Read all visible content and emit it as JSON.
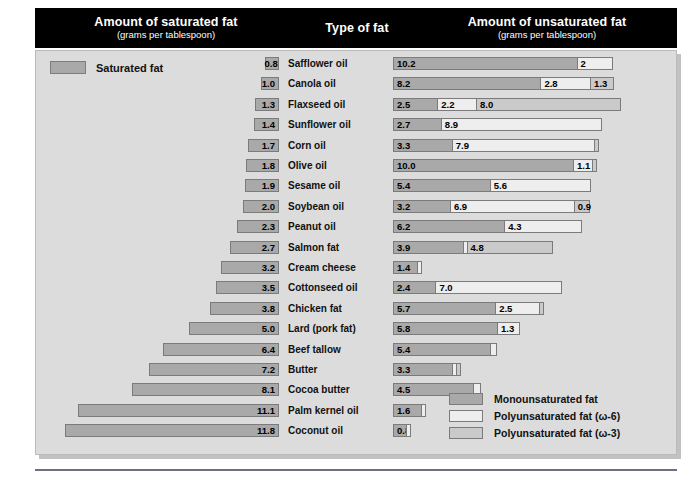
{
  "header": {
    "saturated_title": "Amount of saturated fat",
    "saturated_sub": "(grams per tablespoon)",
    "type_title": "Type of fat",
    "unsaturated_title": "Amount of unsaturated fat",
    "unsaturated_sub": "(grams per tablespoon)"
  },
  "key": {
    "saturated_label": "Saturated fat"
  },
  "legend": {
    "mono": "Monounsaturated fat",
    "omega6": "Polyunsaturated fat (ω-6)",
    "omega3": "Polyunsaturated fat (ω-3)"
  },
  "colors": {
    "monounsaturated": "#a9a9a9",
    "omega6": "#eeeeee",
    "omega3": "#cacaca",
    "panel": "#dcdcdc",
    "header_band": "#000000",
    "rule": "#6f6f84"
  },
  "chart_data": {
    "type": "bar",
    "subtitle": "grams per tablespoon",
    "orientation": "horizontal-diverging",
    "xlabel": "grams per tablespoon",
    "ylabel": "Type of fat",
    "grid": false,
    "legend_position": "bottom-right",
    "left_axis": {
      "label": "Amount of saturated fat",
      "units": "grams per tablespoon",
      "direction": "right-to-left",
      "max": 11.8
    },
    "right_axis": {
      "label": "Amount of unsaturated fat",
      "units": "grams per tablespoon",
      "direction": "left-to-right",
      "max": 12.7
    },
    "series": [
      {
        "name": "Saturated fat",
        "key": "saturated",
        "color": "#a9a9a9"
      },
      {
        "name": "Monounsaturated fat",
        "key": "monounsaturated",
        "color": "#a9a9a9"
      },
      {
        "name": "Polyunsaturated fat (ω-6)",
        "key": "omega6",
        "color": "#eeeeee"
      },
      {
        "name": "Polyunsaturated fat (ω-3)",
        "key": "omega3",
        "color": "#cacaca"
      }
    ],
    "categories": [
      "Safflower oil",
      "Canola oil",
      "Flaxseed oil",
      "Sunflower oil",
      "Corn oil",
      "Olive oil",
      "Sesame oil",
      "Soybean oil",
      "Peanut oil",
      "Salmon fat",
      "Cream cheese",
      "Cottonseed oil",
      "Chicken fat",
      "Lard (pork fat)",
      "Beef tallow",
      "Butter",
      "Cocoa butter",
      "Palm kernel oil",
      "Coconut oil"
    ],
    "rows": [
      {
        "name": "Safflower oil",
        "saturated": 0.8,
        "saturated_label": "0.8",
        "monounsaturated": 10.2,
        "mono_label": "10.2",
        "omega6": 2.0,
        "omega6_label": "2",
        "omega3": 0.0,
        "omega3_label": ""
      },
      {
        "name": "Canola oil",
        "saturated": 1.0,
        "saturated_label": "1.0",
        "monounsaturated": 8.2,
        "mono_label": "8.2",
        "omega6": 2.8,
        "omega6_label": "2.8",
        "omega3": 1.3,
        "omega3_label": "1.3"
      },
      {
        "name": "Flaxseed oil",
        "saturated": 1.3,
        "saturated_label": "1.3",
        "monounsaturated": 2.5,
        "mono_label": "2.5",
        "omega6": 2.2,
        "omega6_label": "2.2",
        "omega3": 8.0,
        "omega3_label": "8.0"
      },
      {
        "name": "Sunflower oil",
        "saturated": 1.4,
        "saturated_label": "1.4",
        "monounsaturated": 2.7,
        "mono_label": "2.7",
        "omega6": 8.9,
        "omega6_label": "8.9",
        "omega3": 0.0,
        "omega3_label": ""
      },
      {
        "name": "Corn oil",
        "saturated": 1.7,
        "saturated_label": "1.7",
        "monounsaturated": 3.3,
        "mono_label": "3.3",
        "omega6": 7.9,
        "omega6_label": "7.9",
        "omega3": 0.15,
        "omega3_label": ""
      },
      {
        "name": "Olive oil",
        "saturated": 1.8,
        "saturated_label": "1.8",
        "monounsaturated": 10.0,
        "mono_label": "10.0",
        "omega6": 1.1,
        "omega6_label": "1.1",
        "omega3": 0.1,
        "omega3_label": ""
      },
      {
        "name": "Sesame oil",
        "saturated": 1.9,
        "saturated_label": "1.9",
        "monounsaturated": 5.4,
        "mono_label": "5.4",
        "omega6": 5.6,
        "omega6_label": "5.6",
        "omega3": 0.0,
        "omega3_label": ""
      },
      {
        "name": "Soybean oil",
        "saturated": 2.0,
        "saturated_label": "2.0",
        "monounsaturated": 3.2,
        "mono_label": "3.2",
        "omega6": 6.9,
        "omega6_label": "6.9",
        "omega3": 0.9,
        "omega3_label": "0.9"
      },
      {
        "name": "Peanut oil",
        "saturated": 2.3,
        "saturated_label": "2.3",
        "monounsaturated": 6.2,
        "mono_label": "6.2",
        "omega6": 4.3,
        "omega6_label": "4.3",
        "omega3": 0.0,
        "omega3_label": ""
      },
      {
        "name": "Salmon fat",
        "saturated": 2.7,
        "saturated_label": "2.7",
        "monounsaturated": 3.9,
        "mono_label": "3.9",
        "omega6": 0.2,
        "omega6_label": "",
        "omega3": 4.8,
        "omega3_label": "4.8"
      },
      {
        "name": "Cream cheese",
        "saturated": 3.2,
        "saturated_label": "3.2",
        "monounsaturated": 1.4,
        "mono_label": "1.4",
        "omega6": 0.2,
        "omega6_label": "",
        "omega3": 0.0,
        "omega3_label": ""
      },
      {
        "name": "Cottonseed oil",
        "saturated": 3.5,
        "saturated_label": "3.5",
        "monounsaturated": 2.4,
        "mono_label": "2.4",
        "omega6": 7.0,
        "omega6_label": "7.0",
        "omega3": 0.0,
        "omega3_label": ""
      },
      {
        "name": "Chicken fat",
        "saturated": 3.8,
        "saturated_label": "3.8",
        "monounsaturated": 5.7,
        "mono_label": "5.7",
        "omega6": 2.5,
        "omega6_label": "2.5",
        "omega3": 0.1,
        "omega3_label": ""
      },
      {
        "name": "Lard (pork fat)",
        "saturated": 5.0,
        "saturated_label": "5.0",
        "monounsaturated": 5.8,
        "mono_label": "5.8",
        "omega6": 1.3,
        "omega6_label": "1.3",
        "omega3": 0.0,
        "omega3_label": ""
      },
      {
        "name": "Beef tallow",
        "saturated": 6.4,
        "saturated_label": "6.4",
        "monounsaturated": 5.4,
        "mono_label": "5.4",
        "omega6": 0.4,
        "omega6_label": "",
        "omega3": 0.0,
        "omega3_label": ""
      },
      {
        "name": "Butter",
        "saturated": 7.2,
        "saturated_label": "7.2",
        "monounsaturated": 3.3,
        "mono_label": "3.3",
        "omega6": 0.3,
        "omega6_label": "",
        "omega3": 0.2,
        "omega3_label": ""
      },
      {
        "name": "Cocoa butter",
        "saturated": 8.1,
        "saturated_label": "8.1",
        "monounsaturated": 4.5,
        "mono_label": "4.5",
        "omega6": 0.4,
        "omega6_label": "",
        "omega3": 0.0,
        "omega3_label": ""
      },
      {
        "name": "Palm kernel oil",
        "saturated": 11.1,
        "saturated_label": "11.1",
        "monounsaturated": 1.6,
        "mono_label": "1.6",
        "omega6": 0.2,
        "omega6_label": "",
        "omega3": 0.0,
        "omega3_label": ""
      },
      {
        "name": "Coconut oil",
        "saturated": 11.8,
        "saturated_label": "11.8",
        "monounsaturated": 0.8,
        "mono_label": "0.8",
        "omega6": 0.2,
        "omega6_label": "",
        "omega3": 0.0,
        "omega3_label": ""
      }
    ]
  }
}
